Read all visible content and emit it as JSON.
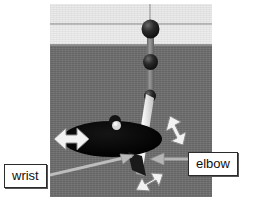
{
  "figure": {
    "kind": "grayscale-photo-illustration",
    "background_colors": {
      "wall_upper": "#e9e9e9",
      "wall_band_line": "#b9b9b9",
      "wall_lower": "#ececec",
      "horizon_edge": "#8f8f8f",
      "floor": "#6d6d6d"
    },
    "accent_colors": {
      "ellipse_fill": "#0a0a0a",
      "arrow_fill": "#f2f2f2",
      "arrow_stroke": "#8c8c8c",
      "pointer_line": "#b5b5b5",
      "rod_gray": "#7e7e7e",
      "rod_white": "#f4f4f4",
      "sphere_dark": "#1d1d1d",
      "label_border": "#2b2b2b",
      "label_background": "#ffffff",
      "label_text": "#111111"
    }
  },
  "labels": {
    "wrist": "wrist",
    "elbow": "elbow"
  },
  "annotations": [
    {
      "id": "dof-left",
      "name": "left-double-arrow",
      "meaning": "horizontal degree of freedom at left of workspace disc"
    },
    {
      "id": "dof-right",
      "name": "right-double-arrow",
      "meaning": "vertical degree of freedom at right of workspace disc"
    },
    {
      "id": "dof-bottom",
      "name": "bottom-double-arrow",
      "meaning": "diagonal degree of freedom below the joint"
    }
  ],
  "parts": {
    "workspace_disc": "workspace-ellipse",
    "upper_link": "upper-arm-link",
    "lower_link": "forearm-link",
    "shoulder_sphere": "upper-joint-sphere",
    "mid_sphere": "mid-joint-sphere",
    "wrist_sphere": "wrist-joint-sphere"
  }
}
